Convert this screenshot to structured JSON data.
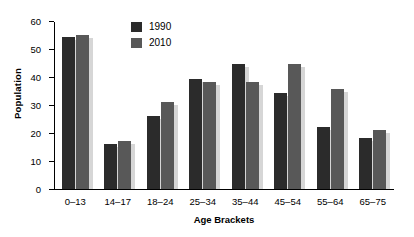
{
  "chart_data": {
    "type": "bar",
    "title": "",
    "xlabel": "Age Brackets",
    "ylabel": "Population",
    "ylim": [
      0,
      60
    ],
    "yticks": [
      0,
      10,
      20,
      30,
      40,
      50,
      60
    ],
    "grid": false,
    "legend_position": "top-center",
    "categories": [
      "0–13",
      "14–17",
      "18–24",
      "25–34",
      "35–44",
      "45–54",
      "55–64",
      "65–75"
    ],
    "series": [
      {
        "name": "1990",
        "color": "#2b2b2b",
        "values": [
          54,
          16,
          26,
          39,
          44.5,
          34,
          22,
          18
        ]
      },
      {
        "name": "2010",
        "color": "#585858",
        "values": [
          55,
          17,
          31,
          38,
          38,
          44.5,
          35.5,
          21
        ]
      }
    ]
  },
  "legend": {
    "items": [
      {
        "label": "1990",
        "color": "#2b2b2b"
      },
      {
        "label": "2010",
        "color": "#585858"
      }
    ]
  }
}
